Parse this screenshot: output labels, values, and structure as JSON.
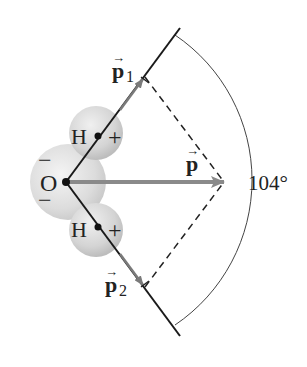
{
  "diagram": {
    "atoms": {
      "oxygen": {
        "symbol": "O",
        "charges": [
          "−",
          "−"
        ]
      },
      "hydrogen_top": {
        "symbol": "H",
        "charge": "+"
      },
      "hydrogen_bottom": {
        "symbol": "H",
        "charge": "+"
      }
    },
    "vectors": {
      "p1": {
        "base": "p",
        "sub": "1",
        "arrow": "→"
      },
      "p2": {
        "base": "p",
        "sub": "2",
        "arrow": "→"
      },
      "p": {
        "base": "p",
        "arrow": "→"
      }
    },
    "angle_label": "104°",
    "colors": {
      "lines": "#1a1a1a",
      "net_vector": "#8a8a8a",
      "sphere_fill": "#d9d9d9",
      "sphere_edge": "#c4c4c4"
    }
  }
}
